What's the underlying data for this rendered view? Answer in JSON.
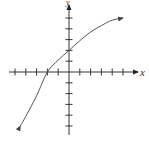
{
  "chart_data": {
    "type": "line",
    "title": "",
    "xlabel": "x",
    "ylabel": "y",
    "xlim": [
      -5.5,
      6
    ],
    "ylim": [
      -5.7,
      6.5
    ],
    "grid": false,
    "tick_spacing": 1,
    "x_ticks": [
      -5,
      -4,
      -3,
      -2,
      -1,
      1,
      2,
      3,
      4,
      5
    ],
    "y_ticks": [
      -5,
      -4,
      -3,
      -2,
      -1,
      1,
      2,
      3,
      4,
      5
    ],
    "tick_labels_shown": false,
    "series": [
      {
        "name": "curve",
        "description": "Increasing, concave-down curve with arrows at both ends; x-intercept at -2, y-intercept at 2",
        "x": [
          -4.5,
          -4,
          -3,
          -2,
          -1,
          0,
          1,
          2,
          3,
          4,
          5
        ],
        "y": [
          -5,
          -4.1,
          -2.2,
          0,
          1.1,
          2,
          2.9,
          3.7,
          4.3,
          4.8,
          5.0
        ]
      }
    ],
    "x_intercept": -2,
    "y_intercept": 2
  },
  "labels": {
    "x_axis": "x",
    "y_axis": "y"
  },
  "colors": {
    "axis": "#333333",
    "curve": "#555555",
    "background": "#ffffff"
  }
}
